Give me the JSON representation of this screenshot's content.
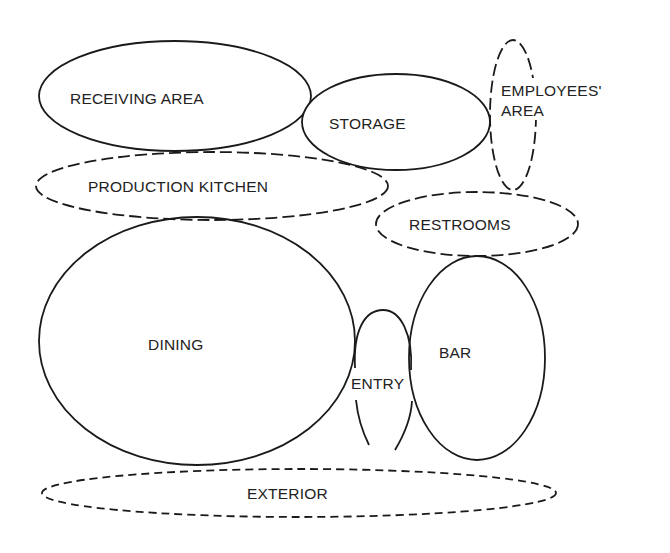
{
  "diagram": {
    "type": "bubble-adjacency-diagram",
    "line_color": "#1a1a1a",
    "background": "#ffffff",
    "zones": [
      {
        "id": "receiving-area",
        "label": "RECEIVING AREA",
        "lines": [
          "RECEIVING AREA"
        ],
        "cx": 175,
        "cy": 96,
        "rx": 136,
        "ry": 55,
        "border": "solid"
      },
      {
        "id": "storage",
        "label": "STORAGE",
        "lines": [
          "STORAGE"
        ],
        "cx": 396,
        "cy": 122,
        "rx": 94,
        "ry": 48,
        "border": "solid"
      },
      {
        "id": "employees-area",
        "label": "EMPLOYEES' AREA",
        "lines": [
          "EMPLOYEES'",
          "AREA"
        ],
        "cx": 513,
        "cy": 115,
        "rx": 23,
        "ry": 75,
        "border": "dashed"
      },
      {
        "id": "production-kitchen",
        "label": "PRODUCTION KITCHEN",
        "lines": [
          "PRODUCTION KITCHEN"
        ],
        "cx": 212,
        "cy": 186,
        "rx": 176,
        "ry": 34,
        "border": "dashed"
      },
      {
        "id": "restrooms",
        "label": "RESTROOMS",
        "lines": [
          "RESTROOMS"
        ],
        "cx": 477,
        "cy": 224,
        "rx": 101,
        "ry": 32,
        "border": "dashed"
      },
      {
        "id": "dining",
        "label": "DINING",
        "lines": [
          "DINING"
        ],
        "cx": 197,
        "cy": 341,
        "rx": 158,
        "ry": 124,
        "border": "solid"
      },
      {
        "id": "entry",
        "label": "ENTRY",
        "lines": [
          "ENTRY"
        ],
        "cx": 383,
        "cy": 378,
        "rx": 29,
        "ry": 69,
        "border": "solid-broken"
      },
      {
        "id": "bar",
        "label": "BAR",
        "lines": [
          "BAR"
        ],
        "cx": 477,
        "cy": 358,
        "rx": 68,
        "ry": 102,
        "border": "solid"
      },
      {
        "id": "exterior",
        "label": "EXTERIOR",
        "lines": [
          "EXTERIOR"
        ],
        "cx": 299,
        "cy": 493,
        "rx": 257,
        "ry": 24,
        "border": "dashed"
      }
    ],
    "labels": {
      "receiving_area": "RECEIVING AREA",
      "storage": "STORAGE",
      "employees_line1": "EMPLOYEES'",
      "employees_line2": "AREA",
      "production_kitchen": "PRODUCTION KITCHEN",
      "restrooms": "RESTROOMS",
      "dining": "DINING",
      "entry": "ENTRY",
      "bar": "BAR",
      "exterior": "EXTERIOR"
    }
  }
}
